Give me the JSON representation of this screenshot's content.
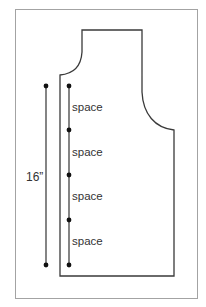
{
  "diagram": {
    "type": "pattern-piece-measurement",
    "measurement_label": "16”",
    "segment_labels": [
      "space",
      "space",
      "space",
      "space"
    ],
    "marker_count_right_line": 5,
    "marker_count_left_line": 2,
    "colors": {
      "frame": "#a3a3a3",
      "outline": "#3a3a3a",
      "marker": "#111111",
      "text": "#333333"
    }
  }
}
